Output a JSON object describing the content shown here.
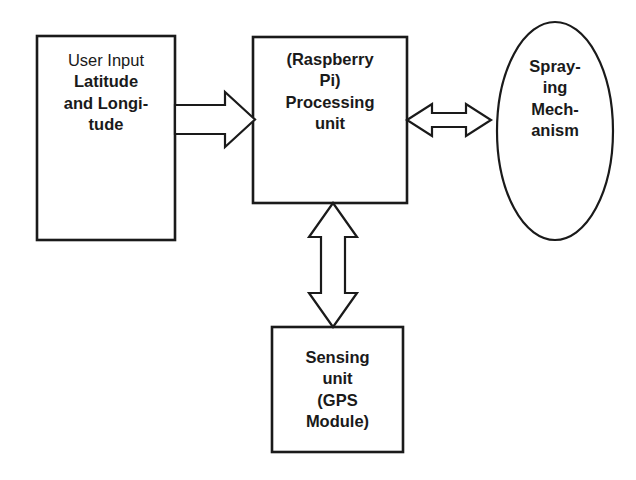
{
  "diagram": {
    "type": "block-diagram",
    "background_color": "#ffffff",
    "stroke_color": "#1a1a1a",
    "text_color": "#1a1a1a",
    "nodes": [
      {
        "id": "user-input",
        "shape": "rectangle",
        "lines": [
          {
            "text": "User Input",
            "weight": "regular"
          },
          {
            "text": "Latitude",
            "weight": "bold"
          },
          {
            "text": "and Longi-",
            "weight": "bold"
          },
          {
            "text": "tude",
            "weight": "bold"
          }
        ]
      },
      {
        "id": "processing-unit",
        "shape": "rectangle",
        "lines": [
          {
            "text": "(Raspberry",
            "weight": "bold"
          },
          {
            "text": "Pi)",
            "weight": "bold"
          },
          {
            "text": "Processing",
            "weight": "bold"
          },
          {
            "text": "unit",
            "weight": "bold"
          }
        ]
      },
      {
        "id": "spraying-mechanism",
        "shape": "ellipse",
        "lines": [
          {
            "text": "Spray-",
            "weight": "bold"
          },
          {
            "text": "ing",
            "weight": "bold"
          },
          {
            "text": "Mech-",
            "weight": "bold"
          },
          {
            "text": "anism",
            "weight": "bold"
          }
        ]
      },
      {
        "id": "sensing-unit",
        "shape": "rectangle",
        "lines": [
          {
            "text": "Sensing",
            "weight": "bold"
          },
          {
            "text": "unit",
            "weight": "bold"
          },
          {
            "text": "(GPS",
            "weight": "bold"
          },
          {
            "text": "Module)",
            "weight": "bold"
          }
        ]
      }
    ],
    "connectors": [
      {
        "id": "user-input-to-processing",
        "style": "hollow-block-arrow",
        "direction": "right",
        "heads": "single",
        "from": "user-input",
        "to": "processing-unit"
      },
      {
        "id": "processing-to-spraying",
        "style": "hollow-block-arrow",
        "direction": "horizontal",
        "heads": "double",
        "from": "processing-unit",
        "to": "spraying-mechanism"
      },
      {
        "id": "processing-to-sensing",
        "style": "hollow-block-arrow",
        "direction": "vertical",
        "heads": "double",
        "from": "processing-unit",
        "to": "sensing-unit"
      }
    ]
  }
}
